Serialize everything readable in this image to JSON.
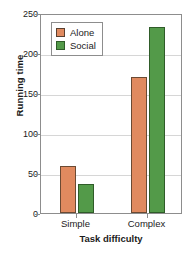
{
  "chart_data": {
    "type": "bar",
    "title": "",
    "xlabel": "Task difficulty",
    "ylabel": "Running time",
    "categories": [
      "Simple",
      "Complex"
    ],
    "series": [
      {
        "name": "Alone",
        "values": [
          59,
          170
        ],
        "color": "#E08A5F"
      },
      {
        "name": "Social",
        "values": [
          36,
          232
        ],
        "color": "#539A49"
      }
    ],
    "ylim": [
      0,
      250
    ],
    "yticks": [
      0,
      50,
      100,
      150,
      200,
      250
    ],
    "ytick_labels": [
      "0",
      "50",
      "100",
      "150",
      "200",
      "250"
    ],
    "grid": "horizontal",
    "legend_position": "top-left-inside",
    "axis_color": "#8d8d8d",
    "grid_color": "#d6d6d6",
    "text_color": "#1b1b1b",
    "background": "#ffffff"
  }
}
